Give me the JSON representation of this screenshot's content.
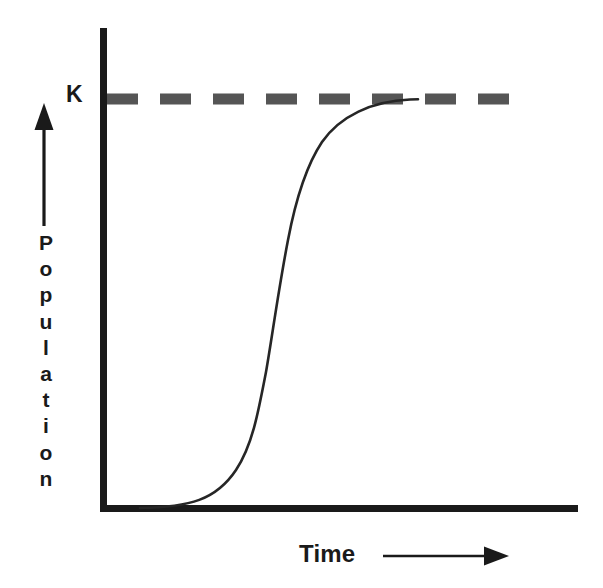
{
  "figure": {
    "background_color": "#ffffff"
  },
  "labels": {
    "carrying_capacity": "K",
    "y_axis": "Population",
    "x_axis": "Time"
  },
  "colors": {
    "axis": "#1a1a1a",
    "curve": "#262626",
    "dashed_line": "#555555",
    "text": "#1a1a1a"
  },
  "chart_data": {
    "type": "line",
    "title": "",
    "xlabel": "Time",
    "ylabel": "Population",
    "grid": false,
    "legend": null,
    "annotations": [
      {
        "text": "K",
        "meaning": "carrying capacity",
        "style": "dashed horizontal asymptote",
        "y_value": 1.0
      }
    ],
    "axis_style": {
      "x_axis": "solid thick with arrow to the right under label",
      "y_axis": "solid thick with separate upward arrow beside label",
      "ticks": "none",
      "tick_labels": "none"
    },
    "xlim": [
      0,
      1
    ],
    "ylim": [
      0,
      1.12
    ],
    "series": [
      {
        "name": "Logistic growth",
        "description": "Sigmoid S-shaped curve approaching carrying capacity K",
        "x": [
          0.0,
          0.05,
          0.1,
          0.15,
          0.2,
          0.25,
          0.3,
          0.33,
          0.36,
          0.39,
          0.42,
          0.45,
          0.48,
          0.52,
          0.56,
          0.6,
          0.65,
          0.7,
          0.75,
          0.8,
          0.85,
          0.9,
          1.0
        ],
        "y": [
          0.005,
          0.008,
          0.013,
          0.022,
          0.036,
          0.058,
          0.095,
          0.13,
          0.18,
          0.25,
          0.34,
          0.45,
          0.56,
          0.69,
          0.79,
          0.86,
          0.92,
          0.955,
          0.975,
          0.987,
          0.994,
          0.998,
          1.0
        ]
      }
    ]
  },
  "geometry": {
    "y_axis": {
      "x": 103.5,
      "y_top": 28,
      "y_bottom": 511,
      "width": 7
    },
    "x_axis": {
      "y": 508.5,
      "x_left": 100,
      "x_right": 578,
      "height": 7
    },
    "dashed_line": {
      "y": 99,
      "x_start": 107,
      "x_end": 527,
      "thickness": 11,
      "dash_length": 31,
      "gap_length": 22
    },
    "y_arrow": {
      "x": 44,
      "y_tip": 104,
      "y_tail": 226
    },
    "x_arrow": {
      "y": 556,
      "x_tail": 383,
      "x_tip": 508
    }
  }
}
